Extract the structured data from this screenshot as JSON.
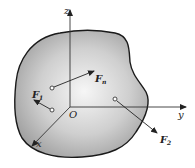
{
  "diagram": {
    "type": "rigid-body-force-system",
    "axes": {
      "x_label": "x",
      "y_label": "y",
      "z_label": "z",
      "origin_label": "O"
    },
    "forces": [
      {
        "id": "F1",
        "base": "F",
        "sub": "1"
      },
      {
        "id": "F2",
        "base": "F",
        "sub": "2"
      },
      {
        "id": "Fn",
        "base": "F",
        "sub": "n"
      }
    ],
    "colors": {
      "body_fill_center": "#f4f4f4",
      "body_fill_edge": "#9c9c9c",
      "outline": "#1a1a1a",
      "axis": "#333333"
    }
  }
}
